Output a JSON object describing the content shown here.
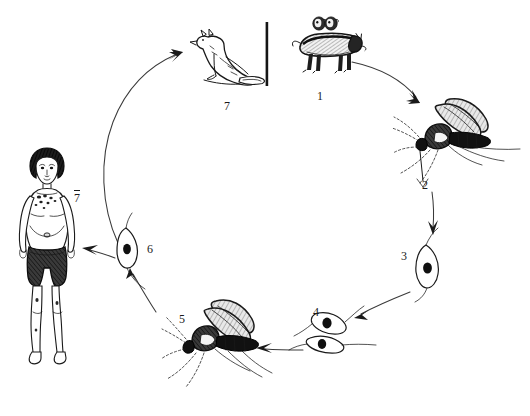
{
  "figure": {
    "background_color": "#ffffff",
    "ink_color": "#1a1a1a",
    "width": 530,
    "height": 416
  },
  "divider": {
    "name": "vertical-separator-bar",
    "x": 267,
    "y_top": 22,
    "y_bottom": 86
  },
  "stages": [
    {
      "id": "1",
      "label": "1",
      "label_x": 317,
      "label_y": 90,
      "subject": "dog-and-rodents",
      "overline": false
    },
    {
      "id": "2",
      "label": "2",
      "label_x": 422,
      "label_y": 179,
      "subject": "sandfly-feeding-right",
      "overline": false
    },
    {
      "id": "3",
      "label": "3",
      "label_x": 401,
      "label_y": 250,
      "subject": "promastigote-single",
      "overline": false
    },
    {
      "id": "4",
      "label": "4",
      "label_x": 313,
      "label_y": 306,
      "subject": "promastigote-dividing",
      "overline": false
    },
    {
      "id": "5",
      "label": "5",
      "label_x": 179,
      "label_y": 313,
      "subject": "sandfly-infective-left",
      "overline": false
    },
    {
      "id": "6",
      "label": "6",
      "label_x": 147,
      "label_y": 243,
      "subject": "amastigote",
      "overline": false
    },
    {
      "id": "7",
      "label": "7",
      "label_x": 224,
      "label_y": 100,
      "subject": "wild-canid-reservoir",
      "overline": false
    },
    {
      "id": "7h",
      "label": "7",
      "label_x": 74,
      "label_y": 190,
      "subject": "human-child-patient",
      "overline": true
    }
  ],
  "arrows": [
    {
      "name": "arrow-dog-to-sandfly",
      "from": "1",
      "to": "2",
      "direction": "down-right"
    },
    {
      "name": "arrow-sandfly-to-promastigote",
      "from": "2",
      "to": "3",
      "direction": "down"
    },
    {
      "name": "arrow-promastigote-to-dividing",
      "from": "3",
      "to": "4",
      "direction": "down-left"
    },
    {
      "name": "arrow-dividing-to-sandfly",
      "from": "4",
      "to": "5",
      "direction": "left"
    },
    {
      "name": "arrow-sandfly-to-amastigote",
      "from": "5",
      "to": "6",
      "direction": "up-left"
    },
    {
      "name": "arrow-amastigote-to-human",
      "from": "6",
      "to": "7h",
      "direction": "left"
    },
    {
      "name": "arrow-amastigote-to-reservoir",
      "from": "6",
      "to": "7",
      "direction": "up-right"
    }
  ]
}
